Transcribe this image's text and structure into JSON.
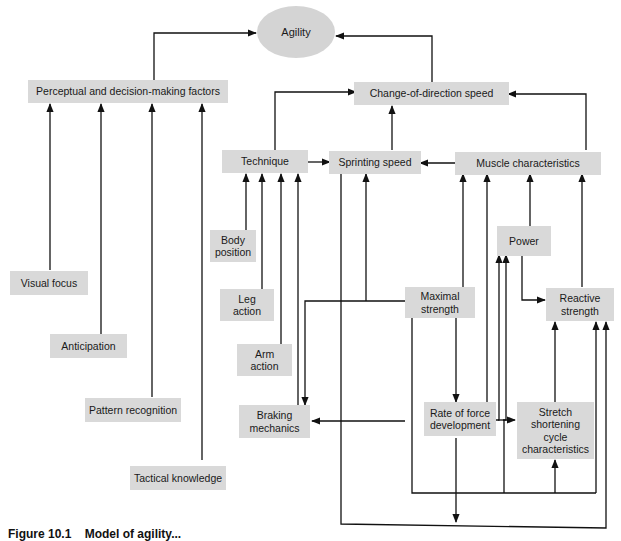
{
  "diagram": {
    "title_node": "Agility",
    "nodes": {
      "agility": "Agility",
      "perceptual": "Perceptual and decision-making factors",
      "cod_speed": "Change-of-direction speed",
      "technique": "Technique",
      "sprinting_speed": "Sprinting speed",
      "muscle_characteristics": "Muscle characteristics",
      "body_position": "Body position",
      "leg_action": "Leg action",
      "arm_action": "Arm action",
      "power": "Power",
      "maximal_strength": "Maximal strength",
      "reactive_strength": "Reactive strength",
      "visual_focus": "Visual focus",
      "anticipation": "Anticipation",
      "pattern_recognition": "Pattern recognition",
      "tactical_knowledge": "Tactical knowledge",
      "braking_mechanics": "Braking mechanics",
      "rate_of_force_development": "Rate of force development",
      "ssc_characteristics": "Stretch shortening cycle characteristics"
    },
    "edges": [
      {
        "from": "Perceptual and decision-making factors",
        "to": "Agility"
      },
      {
        "from": "Change-of-direction speed",
        "to": "Agility"
      },
      {
        "from": "Technique",
        "to": "Change-of-direction speed"
      },
      {
        "from": "Sprinting speed",
        "to": "Change-of-direction speed"
      },
      {
        "from": "Muscle characteristics",
        "to": "Change-of-direction speed"
      },
      {
        "from": "Technique",
        "to": "Sprinting speed"
      },
      {
        "from": "Muscle characteristics",
        "to": "Sprinting speed"
      },
      {
        "from": "Visual focus",
        "to": "Perceptual and decision-making factors"
      },
      {
        "from": "Anticipation",
        "to": "Perceptual and decision-making factors"
      },
      {
        "from": "Pattern recognition",
        "to": "Perceptual and decision-making factors"
      },
      {
        "from": "Tactical knowledge",
        "to": "Perceptual and decision-making factors"
      },
      {
        "from": "Body position",
        "to": "Technique"
      },
      {
        "from": "Leg action",
        "to": "Technique"
      },
      {
        "from": "Arm action",
        "to": "Technique"
      },
      {
        "from": "Braking mechanics",
        "to": "Technique"
      },
      {
        "from": "Maximal strength",
        "to": "Sprinting speed"
      },
      {
        "from": "Maximal strength",
        "to": "Braking mechanics"
      },
      {
        "from": "Maximal strength",
        "to": "Muscle characteristics"
      },
      {
        "from": "Maximal strength",
        "to": "Rate of force development"
      },
      {
        "from": "Power",
        "to": "Muscle characteristics"
      },
      {
        "from": "Power",
        "to": "Reactive strength"
      },
      {
        "from": "Reactive strength",
        "to": "Muscle characteristics"
      },
      {
        "from": "Rate of force development",
        "to": "Braking mechanics"
      },
      {
        "from": "Rate of force development",
        "to": "Muscle characteristics"
      },
      {
        "from": "Rate of force development",
        "to": "Stretch shortening cycle characteristics"
      },
      {
        "from": "Rate of force development",
        "to": "Power"
      },
      {
        "from": "Stretch shortening cycle characteristics",
        "to": "Reactive strength"
      }
    ]
  },
  "caption": {
    "number": "Figure 10.1",
    "text": "Model of agility..."
  }
}
